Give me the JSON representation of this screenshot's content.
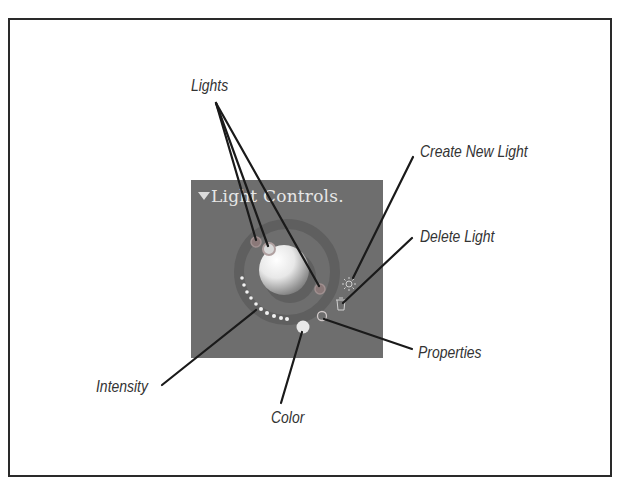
{
  "panel": {
    "title": "Light Controls.",
    "background": "#6e6e6e",
    "collapse_icon": "disclosure-triangle-down"
  },
  "controls": {
    "sphere": "light-preview-sphere",
    "lights": [
      "light-handle-1",
      "light-handle-2",
      "light-handle-3"
    ],
    "create_icon": "sun-icon",
    "delete_icon": "trash-icon",
    "properties_icon": "circle-icon",
    "color_swatch": "#e8e8e8",
    "intensity_dial": "dotted-arc"
  },
  "callouts": {
    "lights": "Lights",
    "create_new_light": "Create New Light",
    "delete_light": "Delete Light",
    "properties": "Properties",
    "intensity": "Intensity",
    "color": "Color"
  }
}
